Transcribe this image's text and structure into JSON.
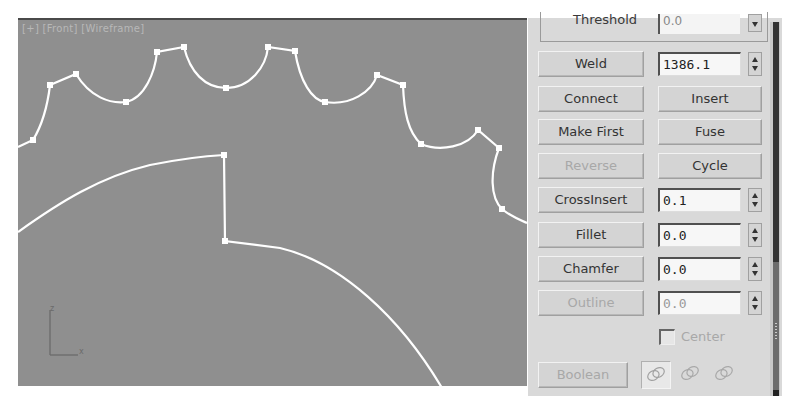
{
  "viewport": {
    "label": "[+] [Front] [Wireframe]",
    "axis_labels": {
      "z": "z",
      "x": "x"
    },
    "colors": {
      "background": "#8f8f8f",
      "spline": "#ffffff"
    },
    "outer_spline_vertices": [
      [
        33,
        138
      ],
      [
        50,
        83
      ],
      [
        76,
        72
      ],
      [
        126,
        100
      ],
      [
        157,
        50
      ],
      [
        184,
        45
      ],
      [
        226,
        86
      ],
      [
        268,
        45
      ],
      [
        295,
        49
      ],
      [
        325,
        100
      ],
      [
        377,
        73
      ],
      [
        403,
        83
      ],
      [
        421,
        142
      ],
      [
        478,
        128
      ],
      [
        499,
        146
      ],
      [
        502,
        207
      ]
    ],
    "inner_spline_vertices": [
      [
        224,
        153
      ],
      [
        225,
        239
      ]
    ]
  },
  "panel": {
    "threshold": {
      "label": "Threshold",
      "value": "0.0"
    },
    "weld": {
      "label": "Weld",
      "value": "1386.1"
    },
    "connect": {
      "label": "Connect"
    },
    "insert": {
      "label": "Insert"
    },
    "make_first": {
      "label": "Make First"
    },
    "fuse": {
      "label": "Fuse"
    },
    "reverse": {
      "label": "Reverse",
      "disabled": true
    },
    "cycle": {
      "label": "Cycle"
    },
    "cross_insert": {
      "label": "CrossInsert",
      "value": "0.1"
    },
    "fillet": {
      "label": "Fillet",
      "value": "0.0"
    },
    "chamfer": {
      "label": "Chamfer",
      "value": "0.0"
    },
    "outline": {
      "label": "Outline",
      "value": "0.0",
      "disabled": true
    },
    "center": {
      "label": "Center",
      "checked": false,
      "disabled": true
    },
    "boolean": {
      "label": "Boolean",
      "disabled": true,
      "operations": [
        "union-icon",
        "subtraction-icon",
        "intersection-icon"
      ]
    }
  }
}
